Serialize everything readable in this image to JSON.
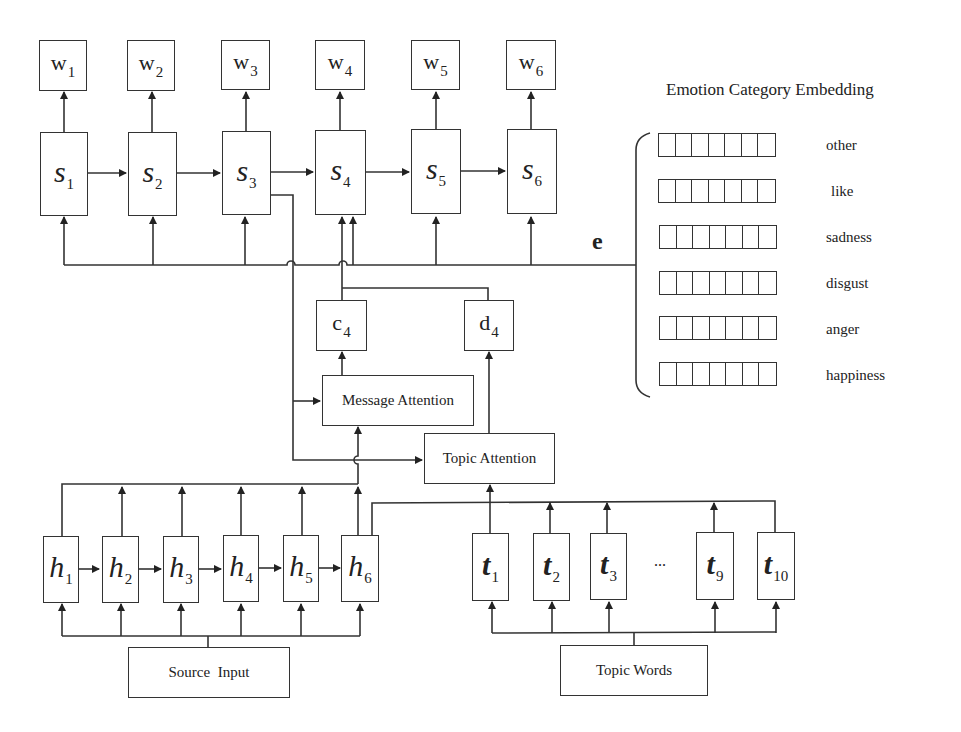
{
  "diagram": {
    "outputs": [
      {
        "base": "w",
        "sub": "1"
      },
      {
        "base": "w",
        "sub": "2"
      },
      {
        "base": "w",
        "sub": "3"
      },
      {
        "base": "w",
        "sub": "4"
      },
      {
        "base": "w",
        "sub": "5"
      },
      {
        "base": "w",
        "sub": "6"
      }
    ],
    "decoder_states": [
      {
        "base": "s",
        "sub": "1"
      },
      {
        "base": "s",
        "sub": "2"
      },
      {
        "base": "s",
        "sub": "3"
      },
      {
        "base": "s",
        "sub": "4"
      },
      {
        "base": "s",
        "sub": "5"
      },
      {
        "base": "s",
        "sub": "6"
      }
    ],
    "encoder_states": [
      {
        "base": "h",
        "sub": "1"
      },
      {
        "base": "h",
        "sub": "2"
      },
      {
        "base": "h",
        "sub": "3"
      },
      {
        "base": "h",
        "sub": "4"
      },
      {
        "base": "h",
        "sub": "5"
      },
      {
        "base": "h",
        "sub": "6"
      }
    ],
    "topic_states": [
      {
        "base": "t",
        "sub": "1"
      },
      {
        "base": "t",
        "sub": "2"
      },
      {
        "base": "t",
        "sub": "3"
      },
      {
        "base": "t",
        "sub": "9"
      },
      {
        "base": "t",
        "sub": "10"
      }
    ],
    "topic_ellipsis": "...",
    "context_vector": {
      "base": "c",
      "sub": "4"
    },
    "topic_vector": {
      "base": "d",
      "sub": "4"
    },
    "message_attention": "Message Attention",
    "topic_attention": "Topic Attention",
    "source_input": "Source Input",
    "topic_words": "Topic Words",
    "emotion_vector_label": "e",
    "emotion_embedding": {
      "title": "Emotion Category Embedding",
      "categories": [
        "other",
        "like",
        "sadness",
        "disgust",
        "anger",
        "happiness"
      ],
      "cells_per_row": 7
    }
  }
}
